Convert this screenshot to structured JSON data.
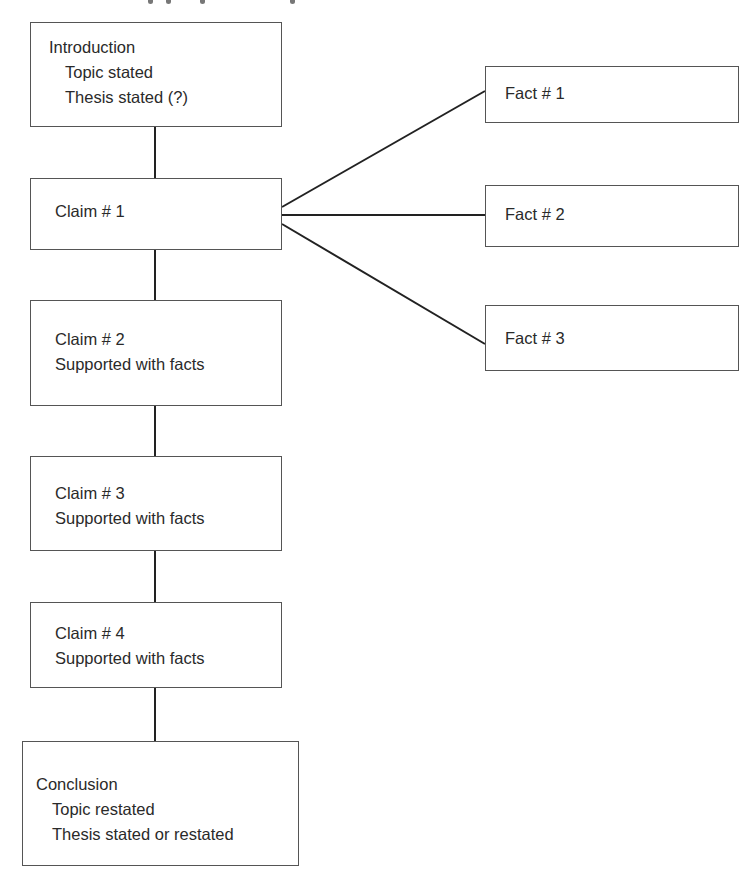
{
  "diagram": {
    "type": "paragraph-structure-organizer",
    "colors": {
      "stroke": "#555555",
      "line": "#222222",
      "text": "#2a2a2a",
      "background": "#ffffff"
    },
    "main_column": [
      {
        "id": "introduction",
        "title": "Introduction",
        "subitems": [
          "Topic stated",
          "Thesis stated (?)"
        ]
      },
      {
        "id": "claim-1",
        "title": "Claim # 1",
        "subitems": []
      },
      {
        "id": "claim-2",
        "title": "Claim # 2",
        "subitems": [
          "Supported with facts"
        ]
      },
      {
        "id": "claim-3",
        "title": "Claim # 3",
        "subitems": [
          "Supported with facts"
        ]
      },
      {
        "id": "claim-4",
        "title": "Claim # 4",
        "subitems": [
          "Supported with facts"
        ]
      },
      {
        "id": "conclusion",
        "title": "Conclusion",
        "subitems": [
          "Topic restated",
          "Thesis stated or restated"
        ]
      }
    ],
    "facts": [
      {
        "id": "fact-1",
        "label": "Fact # 1"
      },
      {
        "id": "fact-2",
        "label": "Fact # 2"
      },
      {
        "id": "fact-3",
        "label": "Fact # 3"
      }
    ],
    "edges": [
      {
        "from": "introduction",
        "to": "claim-1"
      },
      {
        "from": "claim-1",
        "to": "claim-2"
      },
      {
        "from": "claim-2",
        "to": "claim-3"
      },
      {
        "from": "claim-3",
        "to": "claim-4"
      },
      {
        "from": "claim-4",
        "to": "conclusion"
      },
      {
        "from": "claim-1",
        "to": "fact-1"
      },
      {
        "from": "claim-1",
        "to": "fact-2"
      },
      {
        "from": "claim-1",
        "to": "fact-3"
      }
    ]
  }
}
